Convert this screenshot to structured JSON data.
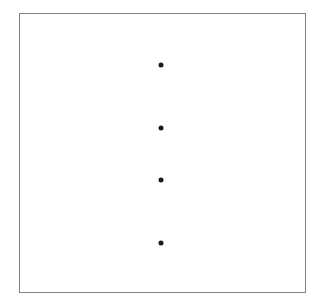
{
  "figure": {
    "width": 323,
    "height": 306,
    "background_color": "#ffffff",
    "panel": {
      "x": 19,
      "y": 13,
      "width": 287,
      "height": 280,
      "border_color": "#7f7f7f",
      "border_width": 1,
      "fill_color": "#ffffff"
    },
    "title": "",
    "xlabel": "",
    "ylabel": "",
    "grid": false,
    "legend": false,
    "tick_labels_x": [],
    "tick_labels_y": [],
    "annotations": []
  },
  "chart_data": {
    "type": "scatter",
    "title": "",
    "xlabel": "",
    "ylabel": "",
    "grid": false,
    "legend_position": "none",
    "marker": {
      "shape": "circle",
      "color": "#1a1a1a",
      "diameter_px": 5
    },
    "axis_ranges": {
      "x_px": [
        19,
        306
      ],
      "y_px": [
        13,
        293
      ]
    },
    "xlim": [
      0,
      287
    ],
    "ylim": [
      0,
      280
    ],
    "series": [
      {
        "name": "points",
        "color": "#1a1a1a",
        "points": [
          {
            "index": 1,
            "x_px": 161,
            "y_px": 65,
            "x_panel": 142,
            "y_panel": 52
          },
          {
            "index": 2,
            "x_px": 161,
            "y_px": 128,
            "x_panel": 142,
            "y_panel": 115
          },
          {
            "index": 3,
            "x_px": 161,
            "y_px": 180,
            "x_panel": 142,
            "y_panel": 167
          },
          {
            "index": 4,
            "x_px": 161,
            "y_px": 243,
            "x_panel": 142,
            "y_panel": 230
          }
        ]
      }
    ],
    "point_count": 4,
    "vertical_gaps_px": [
      63,
      52,
      63
    ]
  }
}
